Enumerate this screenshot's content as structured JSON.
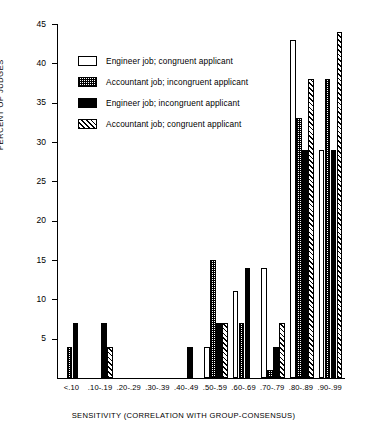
{
  "chart_data": {
    "type": "bar",
    "title": "",
    "xlabel": "SENSITIVITY (CORRELATION WITH GROUP-CONSENSUS)",
    "ylabel": "PERCENT OF JUDGES",
    "ylim": [
      0,
      45
    ],
    "yticks": [
      5,
      10,
      15,
      20,
      25,
      30,
      35,
      40,
      45
    ],
    "ytick_labels": [
      "5",
      "10",
      "15",
      "20",
      "25",
      "30",
      "35",
      "40",
      "45"
    ],
    "grid": false,
    "legend_position": "upper-left-inside",
    "categories": [
      "<.10",
      ".10-.19",
      ".20-.29",
      ".30-.39",
      ".40-.49",
      ".50-.59",
      ".60-.69",
      ".70-.79",
      ".80-.89",
      ".90-.99"
    ],
    "series": [
      {
        "name": "Engineer job; congruent applicant",
        "pattern": "white",
        "values": [
          0,
          0,
          0,
          0,
          0,
          4,
          11,
          14,
          43,
          29
        ]
      },
      {
        "name": "Accountant job; incongruent applicant",
        "pattern": "dotted",
        "values": [
          4,
          0,
          0,
          0,
          0,
          15,
          7,
          1,
          33,
          38
        ]
      },
      {
        "name": "Engineer job; incongruent applicant",
        "pattern": "black",
        "values": [
          7,
          7,
          0,
          0,
          4,
          7,
          14,
          4,
          29,
          29
        ]
      },
      {
        "name": "Accountant job; congruent applicant",
        "pattern": "hatched",
        "values": [
          0,
          4,
          0,
          0,
          0,
          7,
          0,
          7,
          38,
          44
        ]
      }
    ]
  },
  "legend": {
    "items": [
      {
        "label": "Engineer job; congruent applicant",
        "pattern": "white"
      },
      {
        "label": "Accountant job; incongruent applicant",
        "pattern": "dotted"
      },
      {
        "label": "Engineer job; incongruent applicant",
        "pattern": "black"
      },
      {
        "label": "Accountant job; congruent applicant",
        "pattern": "hatched"
      }
    ]
  }
}
